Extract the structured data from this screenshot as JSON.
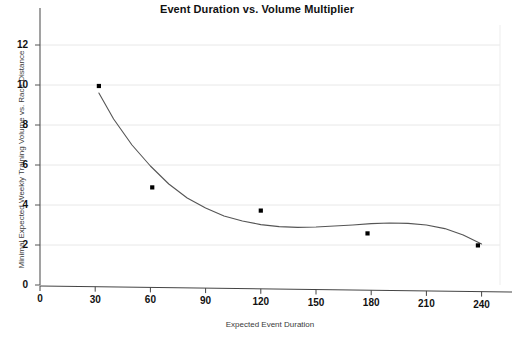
{
  "chart_data": {
    "type": "scatter",
    "title": "Event Duration vs. Volume Multiplier",
    "xlabel": "Expected Event Duration",
    "ylabel": "Minimal Expected Weekly Training Volume vs. Race Distance",
    "xlim": [
      0,
      250
    ],
    "ylim": [
      0,
      13
    ],
    "xticks": [
      0,
      30,
      60,
      90,
      120,
      150,
      180,
      210,
      240
    ],
    "yticks": [
      0,
      2,
      4,
      6,
      8,
      10,
      12
    ],
    "xtick_labels": [
      "0",
      "30",
      "60",
      "90",
      "120",
      "150",
      "180",
      "210",
      "240"
    ],
    "ytick_labels": [
      "0",
      "2",
      "4",
      "6",
      "8",
      "10",
      "12"
    ],
    "grid": "horizontal",
    "legend": "none",
    "series": [
      {
        "name": "Volume Multiplier",
        "type": "scatter",
        "marker": "square",
        "color": "#000000",
        "points": [
          {
            "x": 32,
            "y": 9.95
          },
          {
            "x": 61,
            "y": 4.88
          },
          {
            "x": 120,
            "y": 3.72
          },
          {
            "x": 178,
            "y": 2.58
          },
          {
            "x": 238,
            "y": 1.98
          }
        ]
      },
      {
        "name": "Fitted Trend Curve",
        "type": "line",
        "color": "#555555",
        "points": [
          {
            "x": 32,
            "y": 9.6
          },
          {
            "x": 40,
            "y": 8.3
          },
          {
            "x": 50,
            "y": 7.0
          },
          {
            "x": 60,
            "y": 5.95
          },
          {
            "x": 70,
            "y": 5.05
          },
          {
            "x": 80,
            "y": 4.35
          },
          {
            "x": 90,
            "y": 3.85
          },
          {
            "x": 100,
            "y": 3.45
          },
          {
            "x": 110,
            "y": 3.2
          },
          {
            "x": 120,
            "y": 3.02
          },
          {
            "x": 130,
            "y": 2.92
          },
          {
            "x": 140,
            "y": 2.88
          },
          {
            "x": 150,
            "y": 2.9
          },
          {
            "x": 160,
            "y": 2.95
          },
          {
            "x": 170,
            "y": 3.0
          },
          {
            "x": 180,
            "y": 3.07
          },
          {
            "x": 190,
            "y": 3.1
          },
          {
            "x": 200,
            "y": 3.08
          },
          {
            "x": 210,
            "y": 3.0
          },
          {
            "x": 220,
            "y": 2.82
          },
          {
            "x": 230,
            "y": 2.5
          },
          {
            "x": 240,
            "y": 2.05
          }
        ]
      }
    ]
  },
  "axes": {
    "axis_color": "#555555",
    "grid_color": "#e8e8e8"
  }
}
